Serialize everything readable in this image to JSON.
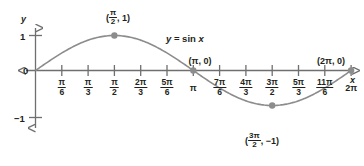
{
  "chart_data": {
    "type": "line",
    "title": "",
    "function": "y = sin x",
    "xlabel": "x",
    "ylabel": "y",
    "xlim": [
      0,
      6.283185307179586
    ],
    "ylim": [
      -1,
      1
    ],
    "grid": false,
    "legend": "none",
    "series": [
      {
        "name": "y = sin x",
        "x": [
          0,
          0.5235987755982988,
          1.0471975511965976,
          1.5707963267948966,
          2.0943951023931953,
          2.6179938779914944,
          3.141592653589793,
          3.6651914291880923,
          4.1887902047863905,
          4.71238898038469,
          5.235987755982989,
          5.759586531581287,
          6.283185307179586
        ],
        "y": [
          0,
          0.5,
          0.8660254037844386,
          1,
          0.8660254037844386,
          0.5,
          0,
          -0.5,
          -0.8660254037844386,
          -1,
          -0.8660254037844386,
          -0.5,
          0
        ]
      }
    ],
    "xticks": [
      {
        "value": 0.5235987755982988,
        "num": "π",
        "den": "6"
      },
      {
        "value": 1.0471975511965976,
        "num": "π",
        "den": "3"
      },
      {
        "value": 1.5707963267948966,
        "num": "π",
        "den": "2"
      },
      {
        "value": 2.0943951023931953,
        "num": "2π",
        "den": "3"
      },
      {
        "value": 2.6179938779914944,
        "num": "5π",
        "den": "6"
      },
      {
        "value": 3.141592653589793,
        "num": "π",
        "den": ""
      },
      {
        "value": 3.6651914291880923,
        "num": "7π",
        "den": "6"
      },
      {
        "value": 4.1887902047863905,
        "num": "4π",
        "den": "3"
      },
      {
        "value": 4.71238898038469,
        "num": "3π",
        "den": "2"
      },
      {
        "value": 5.235987755982989,
        "num": "5π",
        "den": "3"
      },
      {
        "value": 5.759586531581287,
        "num": "11π",
        "den": "6"
      },
      {
        "value": 6.283185307179586,
        "num": "2π",
        "den": ""
      }
    ],
    "yticks": [
      {
        "value": 1,
        "label": "1"
      },
      {
        "value": 0,
        "label": "0"
      },
      {
        "value": -1,
        "label": "−1"
      }
    ],
    "annotations": [
      {
        "name": "maximum-point",
        "x": 1.5707963267948966,
        "y": 1,
        "open": "(",
        "num": "π",
        "den": "2",
        "rest": ", 1)"
      },
      {
        "name": "zero-point-pi",
        "x": 3.141592653589793,
        "y": 0,
        "text": "(π, 0)"
      },
      {
        "name": "zero-point-2pi",
        "x": 6.283185307179586,
        "y": 0,
        "text": "(2π, 0)"
      },
      {
        "name": "minimum-point",
        "x": 4.71238898038469,
        "y": -1,
        "open": "(",
        "num": "3π",
        "den": "2",
        "rest": ", −1)"
      }
    ],
    "curve_color": "#8c8c8c",
    "axis_color": "#6f6f6f",
    "point_color": "#8c8c8c",
    "text_color": "#231f20",
    "background": "#ffffff"
  },
  "axis_labels": {
    "y": "y",
    "x": "x",
    "one": "1",
    "zero": "0",
    "minus_one": "−1"
  },
  "equation_label": {
    "y": "y",
    "eq": " = sin ",
    "x": "x"
  },
  "points": {
    "max": {
      "open": "(",
      "num": "π",
      "den": "2",
      "rest": ", 1)"
    },
    "pi": "(π, 0)",
    "two_pi": "(2π, 0)",
    "min": {
      "open": "(",
      "num": "3π",
      "den": "2",
      "rest": ", −1)"
    }
  },
  "xtick_labels": [
    {
      "num": "π",
      "den": "6"
    },
    {
      "num": "π",
      "den": "3"
    },
    {
      "num": "π",
      "den": "2"
    },
    {
      "num": "2π",
      "den": "3"
    },
    {
      "num": "5π",
      "den": "6"
    },
    {
      "num": "π",
      "den": ""
    },
    {
      "num": "7π",
      "den": "6"
    },
    {
      "num": "4π",
      "den": "3"
    },
    {
      "num": "3π",
      "den": "2"
    },
    {
      "num": "5π",
      "den": "3"
    },
    {
      "num": "11π",
      "den": "6"
    },
    {
      "num": "2π",
      "den": ""
    }
  ]
}
